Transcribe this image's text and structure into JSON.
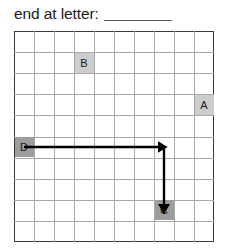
{
  "prompt": {
    "text": "end at letter:",
    "answer_value": "",
    "answer_placeholder": ""
  },
  "grid": {
    "columns": 10,
    "rows": 10,
    "cell_size": 20,
    "border_color": "#3a3a3a",
    "line_color": "#a9a9aa",
    "background_color": "#ffffff"
  },
  "cells": [
    {
      "label": "B",
      "col": 3,
      "row": 1,
      "shade": "light",
      "color": "#cdcdcd"
    },
    {
      "label": "A",
      "col": 9,
      "row": 3,
      "shade": "light",
      "color": "#cdcdcd"
    },
    {
      "label": "D",
      "col": 0,
      "row": 5,
      "shade": "dark",
      "color": "#9d9d9d"
    },
    {
      "label": "C",
      "col": 7,
      "row": 8,
      "shade": "dark",
      "color": "#9d9d9d"
    }
  ],
  "path": {
    "start_label": "D",
    "end_label": "C",
    "color": "#000000",
    "stroke_width": 2.4,
    "segments": [
      {
        "direction": "right",
        "from_col": 0,
        "from_row": 5,
        "to_col": 7,
        "to_row": 5,
        "arrowhead": true
      },
      {
        "direction": "down",
        "from_col": 7,
        "from_row": 5,
        "to_col": 7,
        "to_row": 8,
        "arrowhead": true
      }
    ]
  }
}
